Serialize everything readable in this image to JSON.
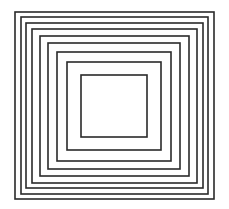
{
  "figure": {
    "width": 229,
    "height": 209,
    "background": "#ffffff",
    "stroke_color": "#2a2a2a",
    "stroke_width": 1.6,
    "squares": [
      {
        "left": 15,
        "top": 12,
        "right": 214,
        "bottom": 199
      },
      {
        "left": 21,
        "top": 17,
        "right": 208,
        "bottom": 194
      },
      {
        "left": 26,
        "top": 23,
        "right": 203,
        "bottom": 188
      },
      {
        "left": 32,
        "top": 29,
        "right": 197,
        "bottom": 183
      },
      {
        "left": 40,
        "top": 36,
        "right": 189,
        "bottom": 176
      },
      {
        "left": 48,
        "top": 43,
        "right": 180,
        "bottom": 169
      },
      {
        "left": 57,
        "top": 52,
        "right": 171,
        "bottom": 161
      },
      {
        "left": 67,
        "top": 62,
        "right": 161,
        "bottom": 150
      },
      {
        "left": 81,
        "top": 75,
        "right": 147,
        "bottom": 137
      }
    ]
  }
}
